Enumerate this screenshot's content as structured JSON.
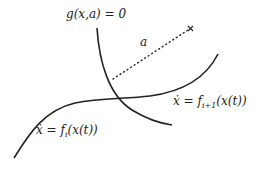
{
  "diagram": {
    "labels": {
      "constraint": "g(x,a) = 0",
      "distance": "a",
      "mode_next_prefix": "ẋ = f",
      "mode_next_sub": "i+1",
      "mode_next_suffix": "(x(t))",
      "mode_current_prefix": "ẋ = f",
      "mode_current_sub": "i",
      "mode_current_suffix": "(x(t))"
    },
    "marker": "×",
    "colors": {
      "stroke": "#222222",
      "background": "#ffffff"
    }
  }
}
